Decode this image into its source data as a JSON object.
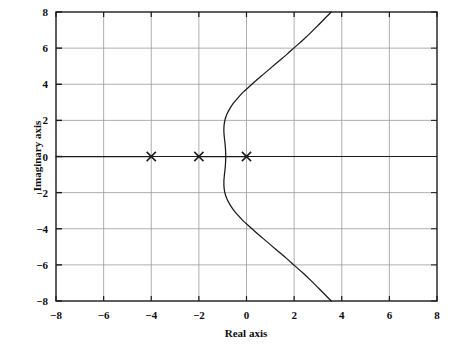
{
  "chart_data": {
    "type": "line",
    "title": "",
    "xlabel": "Real axis",
    "ylabel": "Imaginary axis",
    "xlim": [
      -8,
      8
    ],
    "ylim": [
      -8,
      8
    ],
    "xticks": [
      -8,
      -6,
      -4,
      -2,
      0,
      2,
      4,
      6,
      8
    ],
    "yticks": [
      -8,
      -6,
      -4,
      -2,
      0,
      2,
      4,
      6,
      8
    ],
    "xtick_labels": [
      "−8",
      "−6",
      "−4",
      "−2",
      "0",
      "2",
      "4",
      "6",
      "8"
    ],
    "ytick_labels": [
      "−8",
      "−6",
      "−4",
      "−2",
      "0",
      "2",
      "4",
      "6",
      "8"
    ],
    "grid": true,
    "legend": "none",
    "markers": [
      {
        "label": "pole",
        "symbol": "x",
        "x": -4,
        "y": 0
      },
      {
        "label": "pole",
        "symbol": "x",
        "x": -2,
        "y": 0
      },
      {
        "label": "pole",
        "symbol": "x",
        "x": 0,
        "y": 0
      }
    ],
    "series": [
      {
        "name": "real-axis-locus-left",
        "points": [
          [
            -8,
            0
          ],
          [
            -4,
            0
          ]
        ]
      },
      {
        "name": "real-axis-locus-middle",
        "points": [
          [
            -2,
            0
          ],
          [
            0,
            0
          ]
        ]
      },
      {
        "name": "complex-branch-upper",
        "points": [
          [
            -0.87,
            0.0
          ],
          [
            -0.88,
            0.35
          ],
          [
            -0.9,
            0.7
          ],
          [
            -0.93,
            1.05
          ],
          [
            -0.95,
            1.4
          ],
          [
            -0.94,
            1.75
          ],
          [
            -0.9,
            2.05
          ],
          [
            -0.82,
            2.35
          ],
          [
            -0.7,
            2.65
          ],
          [
            -0.55,
            2.95
          ],
          [
            -0.36,
            3.25
          ],
          [
            -0.15,
            3.55
          ],
          [
            0.1,
            3.85
          ],
          [
            0.38,
            4.18
          ],
          [
            0.68,
            4.52
          ],
          [
            1.0,
            4.88
          ],
          [
            1.34,
            5.26
          ],
          [
            1.68,
            5.64
          ],
          [
            2.02,
            6.04
          ],
          [
            2.36,
            6.44
          ],
          [
            2.7,
            6.86
          ],
          [
            3.02,
            7.28
          ],
          [
            3.32,
            7.68
          ],
          [
            3.56,
            8.0
          ]
        ]
      },
      {
        "name": "complex-branch-lower",
        "points": [
          [
            -0.87,
            0.0
          ],
          [
            -0.88,
            -0.35
          ],
          [
            -0.9,
            -0.7
          ],
          [
            -0.93,
            -1.05
          ],
          [
            -0.95,
            -1.4
          ],
          [
            -0.94,
            -1.75
          ],
          [
            -0.9,
            -2.05
          ],
          [
            -0.82,
            -2.35
          ],
          [
            -0.7,
            -2.65
          ],
          [
            -0.55,
            -2.95
          ],
          [
            -0.36,
            -3.25
          ],
          [
            -0.15,
            -3.55
          ],
          [
            0.1,
            -3.85
          ],
          [
            0.38,
            -4.18
          ],
          [
            0.68,
            -4.52
          ],
          [
            1.0,
            -4.88
          ],
          [
            1.34,
            -5.26
          ],
          [
            1.68,
            -5.64
          ],
          [
            2.02,
            -6.04
          ],
          [
            2.36,
            -6.44
          ],
          [
            2.7,
            -6.86
          ],
          [
            3.02,
            -7.28
          ],
          [
            3.32,
            -7.68
          ],
          [
            3.56,
            -8.0
          ]
        ]
      }
    ]
  },
  "axes": {
    "xlabel": "Real axis",
    "ylabel": "Imaginary axis"
  },
  "xticks": [
    {
      "value": -8,
      "label": "−8"
    },
    {
      "value": -6,
      "label": "−6"
    },
    {
      "value": -4,
      "label": "−4"
    },
    {
      "value": -2,
      "label": "−2"
    },
    {
      "value": 0,
      "label": "0"
    },
    {
      "value": 2,
      "label": "2"
    },
    {
      "value": 4,
      "label": "4"
    },
    {
      "value": 6,
      "label": "6"
    },
    {
      "value": 8,
      "label": "8"
    }
  ],
  "yticks": [
    {
      "value": 8,
      "label": "8"
    },
    {
      "value": 6,
      "label": "6"
    },
    {
      "value": 4,
      "label": "4"
    },
    {
      "value": 2,
      "label": "2"
    },
    {
      "value": 0,
      "label": "0"
    },
    {
      "value": -2,
      "label": "−2"
    },
    {
      "value": -4,
      "label": "−4"
    },
    {
      "value": -6,
      "label": "−6"
    },
    {
      "value": -8,
      "label": "−8"
    }
  ],
  "colors": {
    "axis": "#1a1a1a",
    "grid": "#9a9a9a",
    "curve": "#1a1a1a",
    "marker": "#1a1a1a",
    "background": "#ffffff"
  }
}
